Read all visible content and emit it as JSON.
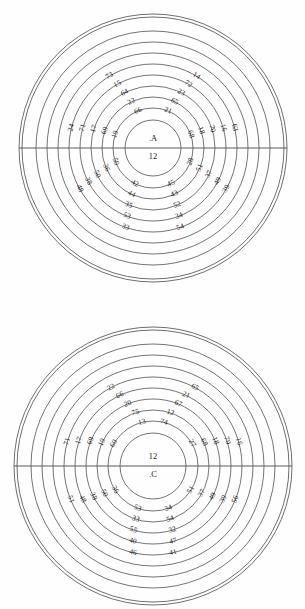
{
  "page": {
    "background_color": "#fefefe",
    "line_color": "#3a3a3a",
    "text_color": "#1c1c1c"
  },
  "chart_data": [
    {
      "type": "diagram",
      "id": "A",
      "title": "Diagram A",
      "center_labels": [
        ".A",
        "12"
      ],
      "center_x": 153,
      "center_y": 148,
      "outer_radius": 134,
      "ring_radii": [
        134,
        131,
        117,
        106,
        95,
        84,
        73,
        62,
        51,
        40,
        28
      ],
      "has_horizontal_axis": true,
      "rings": [
        {
          "index": 1,
          "radius": 40,
          "labels": [
            {
              "value": "66",
              "angle": 112
            },
            {
              "value": "21",
              "angle": 68
            },
            {
              "value": "19",
              "angle": 160
            },
            {
              "value": "68",
              "angle": 20
            },
            {
              "value": "59",
              "angle": 200
            },
            {
              "value": "28",
              "angle": 340
            },
            {
              "value": "42",
              "angle": 243
            },
            {
              "value": "45",
              "angle": 297
            }
          ]
        },
        {
          "index": 2,
          "radius": 51,
          "labels": [
            {
              "value": "22",
              "angle": 115
            },
            {
              "value": "65",
              "angle": 65
            },
            {
              "value": "69",
              "angle": 160
            },
            {
              "value": "18",
              "angle": 20
            },
            {
              "value": "36",
              "angle": 203
            },
            {
              "value": "51",
              "angle": 337
            },
            {
              "value": "44",
              "angle": 245
            },
            {
              "value": "43",
              "angle": 295
            }
          ]
        },
        {
          "index": 3,
          "radius": 62,
          "labels": [
            {
              "value": "64",
              "angle": 117
            },
            {
              "value": "23",
              "angle": 63
            },
            {
              "value": "17",
              "angle": 162
            },
            {
              "value": "70",
              "angle": 18
            },
            {
              "value": "50",
              "angle": 205
            },
            {
              "value": "37",
              "angle": 335
            },
            {
              "value": "35",
              "angle": 247
            },
            {
              "value": "52",
              "angle": 293
            }
          ]
        },
        {
          "index": 4,
          "radius": 73,
          "labels": [
            {
              "value": "15",
              "angle": 119
            },
            {
              "value": "72",
              "angle": 61
            },
            {
              "value": "71",
              "angle": 164
            },
            {
              "value": "16",
              "angle": 16
            },
            {
              "value": "38",
              "angle": 207
            },
            {
              "value": "49",
              "angle": 333
            },
            {
              "value": "53",
              "angle": 249
            },
            {
              "value": "34",
              "angle": 291
            }
          ]
        },
        {
          "index": 5,
          "radius": 84,
          "labels": [
            {
              "value": "73",
              "angle": 121
            },
            {
              "value": "14",
              "angle": 59
            },
            {
              "value": "24",
              "angle": 166
            },
            {
              "value": "63",
              "angle": 14
            },
            {
              "value": "48",
              "angle": 209
            },
            {
              "value": "39",
              "angle": 331
            },
            {
              "value": "33",
              "angle": 251
            },
            {
              "value": "54",
              "angle": 289
            }
          ]
        }
      ]
    },
    {
      "type": "diagram",
      "id": "C",
      "title": "Diagram C",
      "center_labels": [
        "12",
        ".C"
      ],
      "center_x": 153,
      "center_y": 466,
      "outer_radius": 139,
      "ring_radii": [
        139,
        136,
        122,
        111,
        100,
        89,
        78,
        67,
        56,
        45,
        33
      ],
      "has_horizontal_axis": true,
      "rings": [
        {
          "index": 1,
          "radius": 45,
          "labels": [
            {
              "value": "13",
              "angle": 104
            },
            {
              "value": "74",
              "angle": 76
            },
            {
              "value": "60",
              "angle": 150
            },
            {
              "value": "27",
              "angle": 30
            },
            {
              "value": "36",
              "angle": 212
            },
            {
              "value": "51",
              "angle": 328
            },
            {
              "value": "53",
              "angle": 250
            },
            {
              "value": "34",
              "angle": 290
            }
          ]
        },
        {
          "index": 2,
          "radius": 56,
          "labels": [
            {
              "value": "75",
              "angle": 108
            },
            {
              "value": "12",
              "angle": 72
            },
            {
              "value": "19",
              "angle": 155
            },
            {
              "value": "68",
              "angle": 25
            },
            {
              "value": "50",
              "angle": 209
            },
            {
              "value": "37",
              "angle": 331
            },
            {
              "value": "33",
              "angle": 252
            },
            {
              "value": "54",
              "angle": 288
            }
          ]
        },
        {
          "index": 3,
          "radius": 67,
          "labels": [
            {
              "value": "20",
              "angle": 112
            },
            {
              "value": "67",
              "angle": 68
            },
            {
              "value": "69",
              "angle": 158
            },
            {
              "value": "18",
              "angle": 22
            },
            {
              "value": "38",
              "angle": 207
            },
            {
              "value": "49",
              "angle": 333
            },
            {
              "value": "55",
              "angle": 253
            },
            {
              "value": "32",
              "angle": 287
            }
          ]
        },
        {
          "index": 4,
          "radius": 78,
          "labels": [
            {
              "value": "66",
              "angle": 115
            },
            {
              "value": "21",
              "angle": 65
            },
            {
              "value": "17",
              "angle": 161
            },
            {
              "value": "70",
              "angle": 19
            },
            {
              "value": "48",
              "angle": 205
            },
            {
              "value": "39",
              "angle": 335
            },
            {
              "value": "40",
              "angle": 255
            },
            {
              "value": "47",
              "angle": 285
            }
          ]
        },
        {
          "index": 5,
          "radius": 89,
          "labels": [
            {
              "value": "22",
              "angle": 118
            },
            {
              "value": "65",
              "angle": 62
            },
            {
              "value": "71",
              "angle": 164
            },
            {
              "value": "16",
              "angle": 16
            },
            {
              "value": "51",
              "angle": 202
            },
            {
              "value": "56",
              "angle": 338
            },
            {
              "value": "46",
              "angle": 257
            },
            {
              "value": "41",
              "angle": 283
            }
          ]
        }
      ]
    }
  ]
}
